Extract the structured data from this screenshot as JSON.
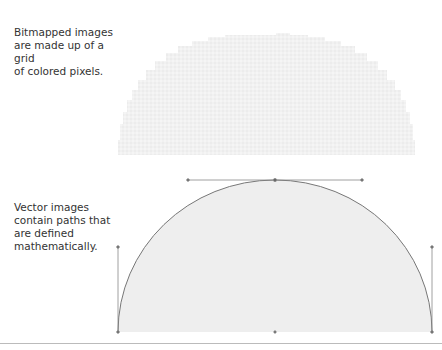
{
  "bitmap_section": {
    "caption": "Bitmapped images\nare made up of a grid\nof colored pixels.",
    "fill_color": "#f2f2f2"
  },
  "vector_section": {
    "caption": "Vector images\ncontain paths that\nare defined\nmathematically.",
    "fill_color": "#efefef",
    "stroke_color": "#777777",
    "handle_color": "#888888"
  }
}
